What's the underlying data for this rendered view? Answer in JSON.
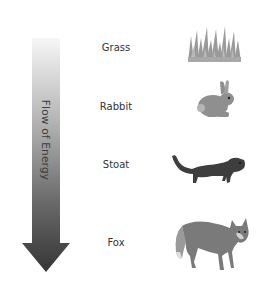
{
  "diagram": {
    "type": "food-chain",
    "arrow": {
      "label": "Flow of Energy",
      "direction": "down",
      "gradient_top": "#f7f7f7",
      "gradient_bottom": "#353535"
    },
    "levels": [
      {
        "label": "Grass",
        "icon": "grass-icon"
      },
      {
        "label": "Rabbit",
        "icon": "rabbit-icon"
      },
      {
        "label": "Stoat",
        "icon": "stoat-icon"
      },
      {
        "label": "Fox",
        "icon": "fox-icon"
      }
    ]
  }
}
